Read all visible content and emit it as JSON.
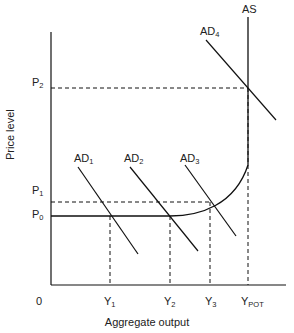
{
  "diagram": {
    "title": "",
    "axes": {
      "y_label": "Price level",
      "x_label": "Aggregate output",
      "origin": "0"
    },
    "price_levels": [
      {
        "id": "P2",
        "main": "P",
        "sub": "2"
      },
      {
        "id": "P1",
        "main": "P",
        "sub": "1"
      },
      {
        "id": "P0",
        "main": "P",
        "sub": "0"
      }
    ],
    "output_levels": [
      {
        "id": "Y1",
        "main": "Y",
        "sub": "1"
      },
      {
        "id": "Y2",
        "main": "Y",
        "sub": "2"
      },
      {
        "id": "Y3",
        "main": "Y",
        "sub": "3"
      },
      {
        "id": "YPOT",
        "main": "Y",
        "sub": "POT"
      }
    ],
    "curves": {
      "as": {
        "label": "AS"
      },
      "ad": [
        {
          "main": "AD",
          "sub": "1"
        },
        {
          "main": "AD",
          "sub": "2"
        },
        {
          "main": "AD",
          "sub": "3"
        },
        {
          "main": "AD",
          "sub": "4"
        }
      ]
    },
    "colors": {
      "line": "#111111",
      "text": "#222222",
      "background": "#ffffff"
    }
  }
}
